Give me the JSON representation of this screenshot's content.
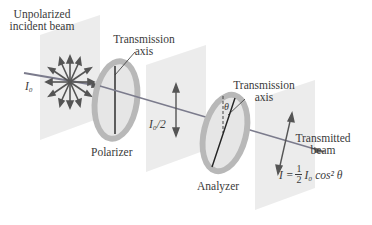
{
  "diagram": {
    "labels": {
      "incident_line1": "Unpolarized",
      "incident_line2": "incident beam",
      "polarizer_axis_line1": "Transmission",
      "polarizer_axis_line2": "axis",
      "incident_intensity": "I₀",
      "polarizer": "Polarizer",
      "half_intensity": "I₀/2",
      "analyzer_axis_line1": "Transmission",
      "analyzer_axis_line2": "axis",
      "angle": "θ",
      "analyzer": "Analyzer",
      "transmitted_line1": "Transmitted",
      "transmitted_line2": "beam",
      "formula_lhs": "I = ",
      "formula_num": "1",
      "formula_den": "2",
      "formula_rhs": "I₀ cos² θ"
    },
    "colors": {
      "panel": "#ededed",
      "ring": "#b5b5b5",
      "ring_inner": "#e4e4e4",
      "beam": "#7a7a8a",
      "arrow": "#555555",
      "line": "#222222"
    }
  }
}
